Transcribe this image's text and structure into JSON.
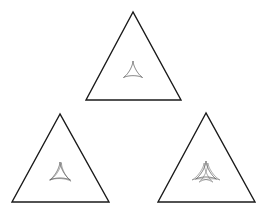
{
  "diagram": {
    "colors": {
      "background": "#ffffff",
      "outline": "#1a1a1a",
      "inner_curve": "#6a6a6a"
    },
    "triangles": [
      {
        "id": "top",
        "apex": [
          133,
          12
        ],
        "base_left": [
          86,
          100
        ],
        "base_right": [
          181,
          100
        ],
        "deltoid_center": [
          133,
          72
        ],
        "deltoid_size": 11,
        "deltoid_copies": 1
      },
      {
        "id": "bottom-left",
        "apex": [
          60,
          114
        ],
        "base_left": [
          12,
          202
        ],
        "base_right": [
          109,
          202
        ],
        "deltoid_center": [
          60,
          174
        ],
        "deltoid_size": 12,
        "deltoid_copies": 2
      },
      {
        "id": "bottom-right",
        "apex": [
          206,
          113
        ],
        "base_left": [
          158,
          202
        ],
        "base_right": [
          255,
          202
        ],
        "deltoid_center": [
          206,
          173
        ],
        "deltoid_size": 12,
        "deltoid_copies": 3
      }
    ]
  }
}
